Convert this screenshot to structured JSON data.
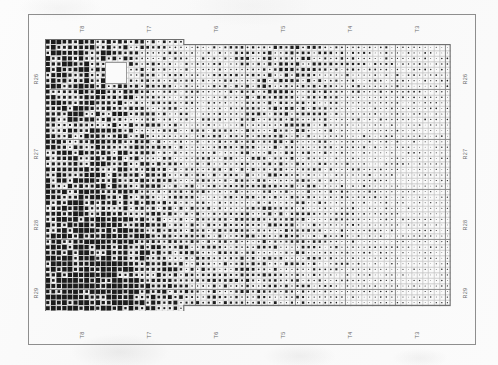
{
  "document": {
    "title": "Excavation Density Grid",
    "frame": {
      "x": 28,
      "y": 14,
      "width": 448,
      "height": 331
    }
  },
  "axes": {
    "top_labels": [
      "T8",
      "T7",
      "T6",
      "T5",
      "T4",
      "T3"
    ],
    "bottom_labels": [
      "T8",
      "T7",
      "T6",
      "T5",
      "T4",
      "T3"
    ],
    "left_labels": [
      "R26",
      "R27",
      "R28",
      "R29"
    ],
    "right_labels": [
      "R26",
      "R27",
      "R28",
      "R29"
    ]
  },
  "colors": {
    "frame": "#8e8e8e",
    "block_rule": "#8c8c8c",
    "cell_rule": "#cfcfcf",
    "dot": "#1b1b1b",
    "paper": "#fbfbfb"
  },
  "chart_data": {
    "type": "heatmap",
    "xlabel": "",
    "ylabel": "",
    "grid": true,
    "legend_position": "none",
    "cell_size_px": 5.55,
    "block_size_cells": 9,
    "columns": 73,
    "rows": 50,
    "x_blocks": [
      {
        "label": "T8",
        "start_col": 0,
        "end_col": 11
      },
      {
        "label": "T7",
        "start_col": 12,
        "end_col": 23
      },
      {
        "label": "T6",
        "start_col": 24,
        "end_col": 35
      },
      {
        "label": "T5",
        "start_col": 36,
        "end_col": 47
      },
      {
        "label": "T4",
        "start_col": 48,
        "end_col": 59
      },
      {
        "label": "T3",
        "start_col": 60,
        "end_col": 72
      }
    ],
    "y_blocks": [
      {
        "label": "R26",
        "start_row": 0,
        "end_row": 12
      },
      {
        "label": "R27",
        "start_row": 13,
        "end_row": 24
      },
      {
        "label": "R28",
        "start_row": 25,
        "end_row": 37
      },
      {
        "label": "R29",
        "start_row": 38,
        "end_row": 49
      }
    ],
    "step_cutouts": [
      {
        "name": "top-right-step",
        "desc": "columns right of col 25 begin one row lower",
        "col_from": 25,
        "rows_removed_top": 1
      },
      {
        "name": "bottom-right-step",
        "desc": "columns right of col 25 end two rows higher",
        "col_from": 25,
        "rows_removed_bottom": 2
      }
    ],
    "blank_square": {
      "name": "unexcavated-square",
      "x_px": 105,
      "y_px": 62,
      "width_px": 21,
      "height_px": 21,
      "col_start": 11,
      "col_end": 14,
      "row_start": 4,
      "row_end": 7
    },
    "density_field": {
      "description": "Relative dot magnitude 0-1 sampled on a coarse 12x9 lattice (cols x rows), bilinearly interpolated for rendering.",
      "cols": 12,
      "rows": 9,
      "values": [
        [
          0.82,
          0.78,
          0.62,
          0.4,
          0.3,
          0.34,
          0.52,
          0.48,
          0.36,
          0.3,
          0.26,
          0.22
        ],
        [
          0.74,
          0.72,
          0.58,
          0.36,
          0.28,
          0.32,
          0.5,
          0.46,
          0.34,
          0.28,
          0.26,
          0.24
        ],
        [
          0.66,
          0.68,
          0.6,
          0.42,
          0.3,
          0.34,
          0.46,
          0.42,
          0.32,
          0.28,
          0.24,
          0.22
        ],
        [
          0.6,
          0.64,
          0.58,
          0.44,
          0.32,
          0.34,
          0.42,
          0.4,
          0.3,
          0.26,
          0.24,
          0.22
        ],
        [
          0.62,
          0.66,
          0.62,
          0.48,
          0.36,
          0.36,
          0.44,
          0.4,
          0.3,
          0.26,
          0.22,
          0.2
        ],
        [
          0.68,
          0.72,
          0.66,
          0.52,
          0.4,
          0.38,
          0.44,
          0.38,
          0.3,
          0.26,
          0.22,
          0.2
        ],
        [
          0.78,
          0.82,
          0.72,
          0.56,
          0.44,
          0.4,
          0.44,
          0.38,
          0.3,
          0.26,
          0.22,
          0.2
        ],
        [
          0.88,
          0.92,
          0.8,
          0.6,
          0.46,
          0.42,
          0.44,
          0.36,
          0.28,
          0.24,
          0.22,
          0.2
        ],
        [
          0.94,
          0.98,
          0.86,
          0.62,
          0.46,
          0.4,
          0.4,
          0.34,
          0.26,
          0.22,
          0.2,
          0.18
        ]
      ]
    }
  }
}
